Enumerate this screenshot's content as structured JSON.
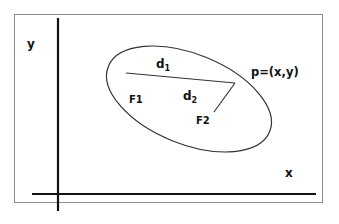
{
  "diagram": {
    "axis_labels": {
      "x": "x",
      "y": "y"
    },
    "foci": [
      {
        "label": "F1"
      },
      {
        "label": "F2"
      }
    ],
    "distances": [
      {
        "label": "d",
        "subscript": "1"
      },
      {
        "label": "d",
        "subscript": "2"
      }
    ],
    "point": {
      "label": "p=(x,y)"
    },
    "colors": {
      "stroke": "#222222",
      "frame": "#888888",
      "background": "#ffffff"
    }
  }
}
